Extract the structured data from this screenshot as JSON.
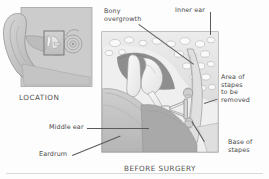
{
  "figure": {
    "kind": "anatomical-diagram",
    "background_color": "#fdfdfd",
    "ink_color": "#4a4a4a"
  },
  "location_panel": {
    "caption": "LOCATION",
    "illustration_name": "ear-profile-illustration",
    "fill_color": "#c9c9c9",
    "border_color": "#8d8d8d",
    "highlight_box_name": "location-highlight-box"
  },
  "main_panel": {
    "caption": "BEFORE SURGERY",
    "illustration_name": "middle-inner-ear-cross-section",
    "border_color": "#9a9a9a",
    "bone_color": "#e3e3e3",
    "cavity_color": "#8e8e8e",
    "ossicle_color": "#f4f4f4"
  },
  "labels": [
    {
      "id": "bony-overgrowth",
      "text": "Bony\novergrowth"
    },
    {
      "id": "inner-ear",
      "text": "Inner ear"
    },
    {
      "id": "area-of-stapes",
      "text": "Area of\nstapes\nto be\nremoved"
    },
    {
      "id": "base-of-stapes",
      "text": "Base of\nstapes"
    },
    {
      "id": "middle-ear",
      "text": "Middle ear"
    },
    {
      "id": "eardrum",
      "text": "Eardrum"
    }
  ]
}
